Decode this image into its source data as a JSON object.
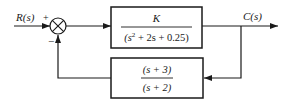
{
  "diagram": {
    "type": "feedback control block diagram",
    "input_label": "R(s)",
    "output_label": "C(s)",
    "summing_junction": {
      "plus_sign": "+",
      "minus_sign": "−"
    },
    "forward_block": {
      "numerator": "K",
      "denominator_parts": {
        "open": "(s",
        "exp": "2",
        "rest": " + 2s + 0.25)"
      },
      "transfer_function": "K / (s^2 + 2s + 0.25)"
    },
    "feedback_block": {
      "numerator": "(s + 3)",
      "denominator": "(s + 2)",
      "transfer_function": "(s + 3) / (s + 2)"
    },
    "colors": {
      "line": "#1a1a1a",
      "background": "#ffffff"
    }
  }
}
